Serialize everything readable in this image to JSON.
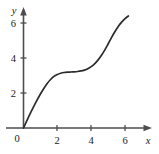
{
  "chart_data": {
    "type": "line",
    "title": "",
    "subtitle": "",
    "xlabel": "x",
    "ylabel": "y",
    "xlim": [
      -0.35,
      7.2
    ],
    "ylim": [
      -0.45,
      7.0
    ],
    "grid": false,
    "legend": null,
    "x_ticks": [
      2,
      4,
      6
    ],
    "y_ticks": [
      2,
      4,
      6
    ],
    "x_tick_labels": [
      "2",
      "4",
      "6"
    ],
    "y_tick_labels": [
      "2",
      "4",
      "6"
    ],
    "origin_label": "0",
    "annotations": [],
    "series": [
      {
        "name": "curve",
        "color": "#2b2b2b",
        "description": "cubic-like increasing curve through the origin with an inflection plateau near (3, 3.2)",
        "x": [
          0.0,
          0.2,
          0.4,
          0.6,
          0.8,
          1.0,
          1.2,
          1.4,
          1.6,
          1.8,
          2.0,
          2.2,
          2.4,
          2.6,
          2.8,
          3.0,
          3.2,
          3.4,
          3.6,
          3.8,
          4.0,
          4.2,
          4.4,
          4.6,
          4.8,
          5.0,
          5.2,
          5.4,
          5.6,
          5.8,
          6.0,
          6.2
        ],
        "y": [
          0.0,
          0.42,
          0.83,
          1.22,
          1.59,
          1.94,
          2.26,
          2.54,
          2.77,
          2.95,
          3.06,
          3.13,
          3.17,
          3.19,
          3.2,
          3.21,
          3.23,
          3.26,
          3.31,
          3.39,
          3.51,
          3.67,
          3.88,
          4.14,
          4.45,
          4.8,
          5.16,
          5.5,
          5.8,
          6.05,
          6.25,
          6.4
        ]
      }
    ]
  },
  "axes": {
    "x_axis_name": "x",
    "y_axis_name": "y",
    "origin_label": "0"
  }
}
